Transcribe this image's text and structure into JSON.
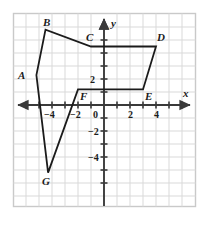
{
  "figure": {
    "title": "",
    "background_color": "#ffffff",
    "border_color": "#c9c9c9",
    "grid_color": "#d8d8d8",
    "axis_color": "#3a3a3a",
    "shape_color": "#1b1b1b",
    "label_color": "#1b1b1b"
  },
  "axes": {
    "x_axis_label": "x",
    "y_axis_label": "y",
    "x_ticks": [
      {
        "value": -4,
        "label": "−4"
      },
      {
        "value": -2,
        "label": "−2"
      },
      {
        "value": 2,
        "label": "2"
      },
      {
        "value": 4,
        "label": "4"
      }
    ],
    "y_ticks": [
      {
        "value": 2,
        "label": "2"
      },
      {
        "value": -2,
        "label": "−2"
      },
      {
        "value": -4,
        "label": "−4"
      }
    ],
    "origin_label": "0"
  },
  "chart_data": {
    "type": "scatter",
    "title": "",
    "xlabel": "x",
    "ylabel": "y",
    "xlim": [
      -7,
      7
    ],
    "ylim": [
      -7,
      7
    ],
    "grid": true,
    "legend": "none",
    "x_tick_values": [
      -4,
      -2,
      0,
      2,
      4
    ],
    "y_tick_values": [
      2,
      0,
      -2,
      -4
    ],
    "polygon": {
      "name": "ABCDEFG",
      "closed": true,
      "vertex_labels": [
        "A",
        "B",
        "C",
        "D",
        "E",
        "F",
        "G"
      ],
      "x": [
        -5.2,
        -4.5,
        -1.0,
        4.0,
        3.0,
        -2.0,
        -4.3
      ],
      "y": [
        2.3,
        5.8,
        4.5,
        4.5,
        1.2,
        1.2,
        -5.2
      ],
      "points": [
        {
          "label": "A",
          "x": -5.2,
          "y": 2.3
        },
        {
          "label": "B",
          "x": -4.5,
          "y": 5.8
        },
        {
          "label": "C",
          "x": -1.0,
          "y": 4.5
        },
        {
          "label": "D",
          "x": 4.0,
          "y": 4.5
        },
        {
          "label": "E",
          "x": 3.0,
          "y": 1.2
        },
        {
          "label": "F",
          "x": -2.0,
          "y": 1.2
        },
        {
          "label": "G",
          "x": -4.3,
          "y": -5.2
        }
      ]
    }
  }
}
